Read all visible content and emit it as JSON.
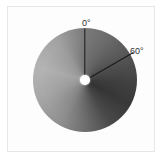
{
  "diagram": {
    "type": "angular grayscale disc",
    "labels": {
      "zero": "0°",
      "sixty": "60°"
    },
    "reference_angles_deg": [
      0,
      60
    ],
    "colors": {
      "ray": "#1a1a1a",
      "hub": "#ffffff",
      "darkest_shade": "#383838",
      "lightest_shade": "#b4b4b4",
      "frame_border": "#e6e6e6"
    }
  }
}
